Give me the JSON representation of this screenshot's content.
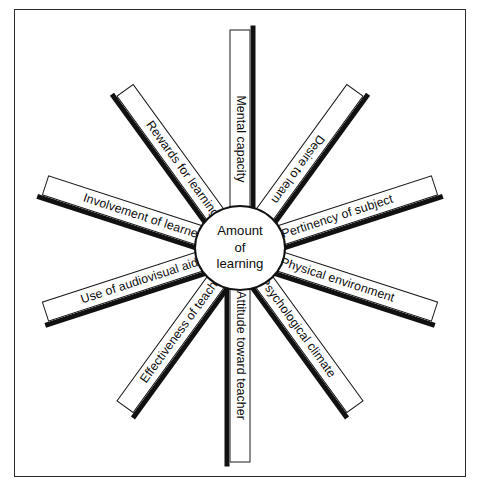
{
  "figure": {
    "type": "radial-spoke-diagram",
    "hub": {
      "line1": "Amount",
      "line2": "of",
      "line3": "learning"
    },
    "spokes": [
      {
        "id": "mental-capacity",
        "label": "Mental capacity",
        "angle_deg": -90,
        "length": 219,
        "flip_text": true,
        "shadow": "bottom"
      },
      {
        "id": "desire-to-learn",
        "label": "Desire to learn",
        "angle_deg": -54,
        "length": 196,
        "flip_text": true,
        "shadow": "bottom"
      },
      {
        "id": "pertinency-of-subject",
        "label": "Pertinency of subject",
        "angle_deg": -18,
        "length": 205,
        "flip_text": false,
        "shadow": "bottom"
      },
      {
        "id": "physical-environment",
        "label": "Physical environment",
        "angle_deg": 18,
        "length": 205,
        "flip_text": false,
        "shadow": "bottom"
      },
      {
        "id": "psychological-climate",
        "label": "Psychological climate",
        "angle_deg": 54,
        "length": 196,
        "flip_text": false,
        "shadow": "bottom"
      },
      {
        "id": "attitude-toward-teacher",
        "label": "Attitude toward teacher",
        "angle_deg": 90,
        "length": 214,
        "flip_text": false,
        "shadow": "bottom"
      },
      {
        "id": "effectiveness-of-teacher",
        "label": "Effectiveness of teacher",
        "angle_deg": 126,
        "length": 196,
        "flip_text": true,
        "shadow": "top"
      },
      {
        "id": "use-of-audiovisual-aids",
        "label": "Use of audiovisual aids",
        "angle_deg": 162,
        "length": 205,
        "flip_text": true,
        "shadow": "top"
      },
      {
        "id": "involvement-of-learner",
        "label": "Involvement of learner",
        "angle_deg": 198,
        "length": 205,
        "flip_text": true,
        "shadow": "top"
      },
      {
        "id": "rewards-for-learning",
        "label": "Rewards for learning",
        "angle_deg": 234,
        "length": 196,
        "flip_text": true,
        "shadow": "top"
      }
    ],
    "colors": {
      "spoke_fill": "#ffffff",
      "spoke_outline": "#1a1a1a",
      "spoke_shadow": "#111111",
      "frame": "#2b2b2b",
      "text": "#0d0d0d",
      "background": "#ffffff"
    }
  }
}
